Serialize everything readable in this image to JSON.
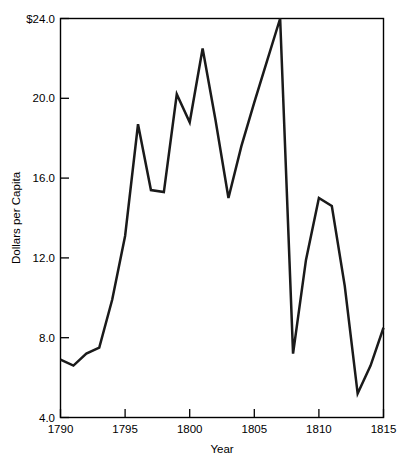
{
  "chart_data": {
    "type": "line",
    "title": "",
    "xlabel": "Year",
    "ylabel": "Dollars per Capita",
    "xlim": [
      1790,
      1815
    ],
    "ylim": [
      4.0,
      24.0
    ],
    "grid": false,
    "legend": "none",
    "x_ticks": [
      1790,
      1795,
      1800,
      1805,
      1810,
      1815
    ],
    "x_tick_labels": [
      "1790",
      "1795",
      "1800",
      "1805",
      "1810",
      "1815"
    ],
    "y_ticks": [
      4.0,
      8.0,
      12.0,
      16.0,
      20.0,
      24.0
    ],
    "y_tick_labels": [
      "4.0",
      "8.0",
      "12.0",
      "16.0",
      "20.0",
      "$24.0"
    ],
    "x": [
      1790,
      1791,
      1792,
      1793,
      1794,
      1795,
      1796,
      1797,
      1798,
      1799,
      1800,
      1801,
      1802,
      1803,
      1804,
      1805,
      1806,
      1807,
      1808,
      1809,
      1810,
      1811,
      1812,
      1813,
      1814,
      1815
    ],
    "values": [
      6.9,
      6.6,
      7.2,
      7.5,
      9.9,
      13.1,
      18.7,
      15.4,
      15.3,
      20.2,
      18.8,
      22.5,
      18.9,
      15.0,
      17.6,
      19.8,
      21.9,
      24.0,
      7.2,
      11.9,
      15.0,
      14.6,
      10.6,
      5.2,
      6.6,
      8.5
    ],
    "series": [
      {
        "name": "Dollars per Capita",
        "values": [
          6.9,
          6.6,
          7.2,
          7.5,
          9.9,
          13.1,
          18.7,
          15.4,
          15.3,
          20.2,
          18.8,
          22.5,
          18.9,
          15.0,
          17.6,
          19.8,
          21.9,
          24.0,
          7.2,
          11.9,
          15.0,
          14.6,
          10.6,
          5.2,
          6.6,
          8.5
        ]
      }
    ],
    "line_color": "#1a1a1a"
  },
  "axes": {
    "x_title": "Year",
    "y_title": "Dollars per Capita"
  }
}
